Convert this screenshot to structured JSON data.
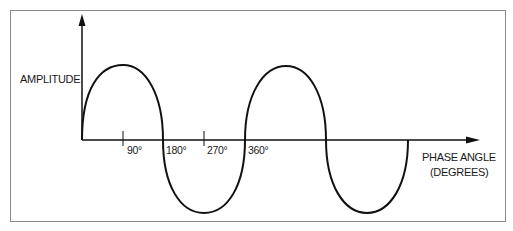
{
  "diagram": {
    "y_axis_label": "AMPLITUDE",
    "x_axis_label_line1": "PHASE ANGLE",
    "x_axis_label_line2": "(DEGREES)",
    "ticks": [
      {
        "label": "90°"
      },
      {
        "label": "180°"
      },
      {
        "label": "270°"
      },
      {
        "label": "360°"
      }
    ],
    "curve": "sine wave, two full cycles (0° to 720°)",
    "colors": {
      "line": "#111111",
      "frame": "#8a8a8a",
      "background": "#ffffff"
    }
  }
}
